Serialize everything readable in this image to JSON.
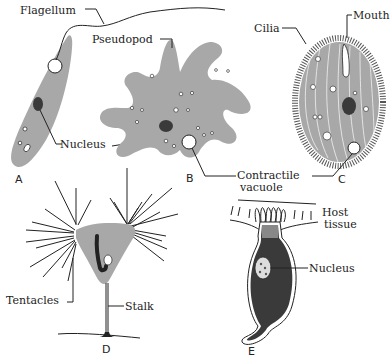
{
  "colors": {
    "cytoplasm": "#a8a8a8",
    "nucleus": "#2a2a2a",
    "line": "#222222",
    "background": "#ffffff"
  },
  "organisms": [
    {
      "id": "A",
      "letter": "A",
      "labels": [
        "Flagellum",
        "Nucleus"
      ]
    },
    {
      "id": "B",
      "letter": "B",
      "labels": [
        "Pseudopod",
        "Contractile vacuole"
      ]
    },
    {
      "id": "C",
      "letter": "C",
      "labels": [
        "Cilia",
        "Mouth"
      ]
    },
    {
      "id": "D",
      "letter": "D",
      "labels": [
        "Tentacles",
        "Stalk"
      ]
    },
    {
      "id": "E",
      "letter": "E",
      "labels": [
        "Host tissue",
        "Nucleus"
      ]
    }
  ],
  "labels": {
    "flagellum": "Flagellum",
    "pseudopod": "Pseudopod",
    "cilia": "Cilia",
    "mouth": "Mouth",
    "nucleus_a": "Nucleus",
    "contractile": "Contractile",
    "vacuole": "vacuole",
    "tentacles": "Tentacles",
    "stalk": "Stalk",
    "host": "Host",
    "tissue": "tissue",
    "nucleus_e": "Nucleus",
    "letter_a": "A",
    "letter_b": "B",
    "letter_c": "C",
    "letter_d": "D",
    "letter_e": "E"
  }
}
